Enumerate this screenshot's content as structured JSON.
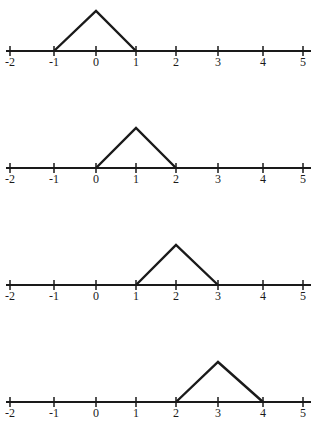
{
  "chart_data": [
    {
      "type": "line",
      "title": "",
      "xlabel": "",
      "ylabel": "",
      "xlim": [
        -2,
        5
      ],
      "ylim": [
        0,
        1
      ],
      "grid": false,
      "tick_labels": [
        "-2",
        "-1",
        "0",
        "1",
        "2",
        "3",
        "4",
        "5"
      ],
      "series": [
        {
          "name": "hat function centered at 0",
          "x": [
            -1,
            0,
            1
          ],
          "y": [
            0,
            1,
            0
          ]
        }
      ]
    },
    {
      "type": "line",
      "title": "",
      "xlabel": "",
      "ylabel": "",
      "xlim": [
        -2,
        5
      ],
      "ylim": [
        0,
        1
      ],
      "grid": false,
      "tick_labels": [
        "-2",
        "-1",
        "0",
        "1",
        "2",
        "3",
        "4",
        "5"
      ],
      "series": [
        {
          "name": "hat function centered at 1",
          "x": [
            0,
            1,
            2
          ],
          "y": [
            0,
            1,
            0
          ]
        }
      ]
    },
    {
      "type": "line",
      "title": "",
      "xlabel": "",
      "ylabel": "",
      "xlim": [
        -2,
        5
      ],
      "ylim": [
        0,
        1
      ],
      "grid": false,
      "tick_labels": [
        "-2",
        "-1",
        "0",
        "1",
        "2",
        "3",
        "4",
        "5"
      ],
      "series": [
        {
          "name": "hat function centered at 2",
          "x": [
            1,
            2,
            3
          ],
          "y": [
            0,
            1,
            0
          ]
        }
      ]
    },
    {
      "type": "line",
      "title": "",
      "xlabel": "",
      "ylabel": "",
      "xlim": [
        -2,
        5
      ],
      "ylim": [
        0,
        1
      ],
      "grid": false,
      "tick_labels": [
        "-2",
        "-1",
        "0",
        "1",
        "2",
        "3",
        "4",
        "5"
      ],
      "series": [
        {
          "name": "hat function centered at 3",
          "x": [
            2,
            3,
            4
          ],
          "y": [
            0,
            1,
            0
          ]
        }
      ]
    }
  ]
}
